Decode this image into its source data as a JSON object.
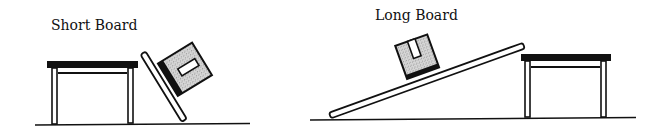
{
  "labels": {
    "short_board": "Short Board",
    "long_board": "Long Board"
  },
  "colors": {
    "ink": "#111111",
    "box_fill": "#cfcfcf",
    "background": "#ffffff"
  },
  "scenes": [
    {
      "name": "short-board-scene",
      "title": "Short Board",
      "description": "Short board leaning steeply against a table with a box resting on it"
    },
    {
      "name": "long-board-scene",
      "title": "Long Board",
      "description": "Long board forming a gentle ramp up to a table with a box resting on it"
    }
  ]
}
